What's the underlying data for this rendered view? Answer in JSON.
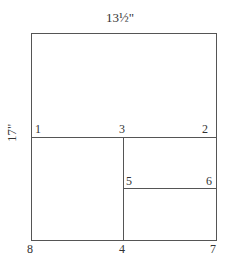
{
  "dimensions": {
    "width_label": "13½\"",
    "height_label": "17\""
  },
  "points": [
    {
      "id": "1",
      "label": "1"
    },
    {
      "id": "2",
      "label": "2"
    },
    {
      "id": "3",
      "label": "3"
    },
    {
      "id": "4",
      "label": "4"
    },
    {
      "id": "5",
      "label": "5"
    },
    {
      "id": "6",
      "label": "6"
    },
    {
      "id": "7",
      "label": "7"
    },
    {
      "id": "8",
      "label": "8"
    }
  ],
  "colors": {
    "line": "#555555",
    "text": "#333333"
  }
}
